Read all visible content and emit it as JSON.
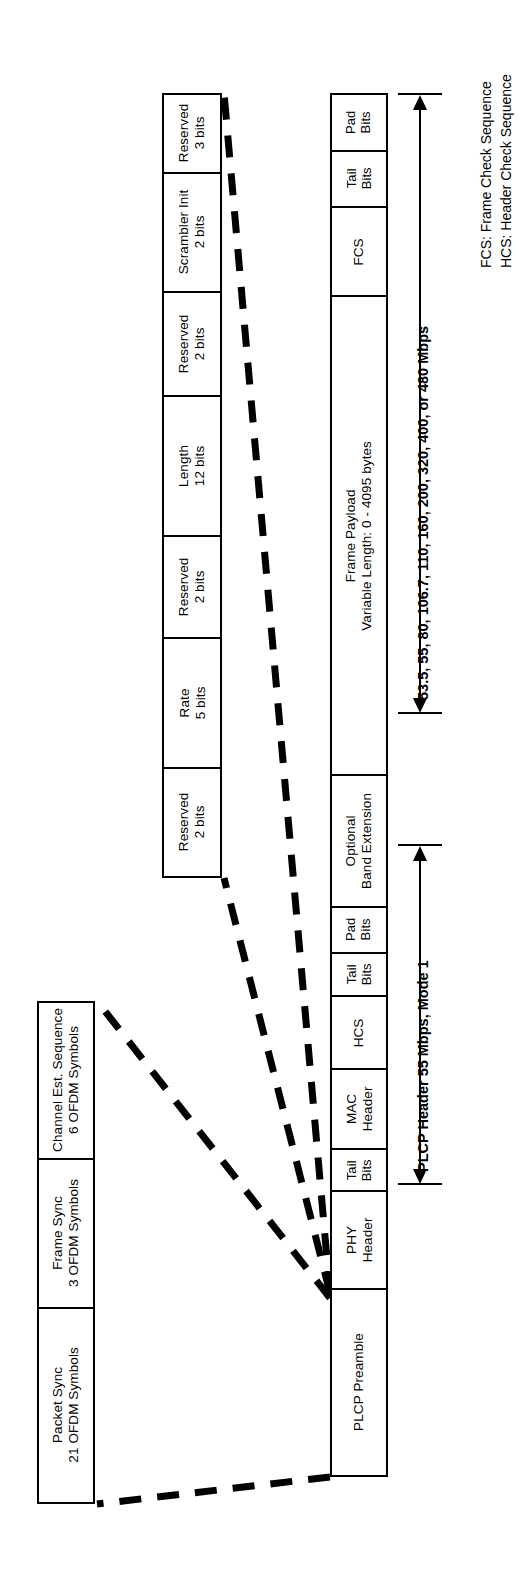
{
  "diagram": {
    "preamble_row": {
      "name": "PLCP Preamble detail",
      "cells": [
        {
          "line1": "Packet Sync",
          "line2": "21 OFDM Symbols"
        },
        {
          "line1": "Frame Sync",
          "line2": "3 OFDM Symbols"
        },
        {
          "line1": "Channel Est. Sequence",
          "line2": "6 OFDM Symbols"
        }
      ]
    },
    "frame_row": {
      "name": "PPDU frame",
      "cells": [
        {
          "line1": "PLCP Preamble",
          "line2": ""
        },
        {
          "line1": "PHY",
          "line2": "Header"
        },
        {
          "line1": "Tail",
          "line2": "Bits"
        },
        {
          "line1": "MAC",
          "line2": "Header"
        },
        {
          "line1": "HCS",
          "line2": ""
        },
        {
          "line1": "Tail",
          "line2": "Bits"
        },
        {
          "line1": "Pad",
          "line2": "Bits"
        },
        {
          "line1": "Optional",
          "line2": "Band Extension"
        },
        {
          "line1": "Frame Payload",
          "line2": "Variable Length: 0 - 4095 bytes"
        },
        {
          "line1": "FCS",
          "line2": ""
        },
        {
          "line1": "Tail",
          "line2": "Bits"
        },
        {
          "line1": "Pad",
          "line2": "Bits"
        }
      ]
    },
    "phy_header_row": {
      "name": "PHY Header bit fields",
      "cells": [
        {
          "line1": "Reserved",
          "line2": "2 bits"
        },
        {
          "line1": "Rate",
          "line2": "5 bits"
        },
        {
          "line1": "Reserved",
          "line2": "2 bits"
        },
        {
          "line1": "Length",
          "line2": "12 bits"
        },
        {
          "line1": "Reserved",
          "line2": "2 bits"
        },
        {
          "line1": "Scrambler Init",
          "line2": "2 bits"
        },
        {
          "line1": "Reserved",
          "line2": "3 bits"
        }
      ]
    },
    "annotations": [
      {
        "name": "payload-rate-annotation",
        "text": "53.5, 55, 80, 106.7, 110, 160, 200, 320, 400, or 480 Mbps"
      },
      {
        "name": "plcp-header-annotation",
        "text": "PLCP Header 55 Mbps, Mode 1"
      }
    ],
    "legend": [
      "FCS: Frame Check Sequence",
      "HCS: Header Check Sequence"
    ],
    "colors": {
      "stroke": "#000000",
      "background": "#ffffff"
    }
  }
}
